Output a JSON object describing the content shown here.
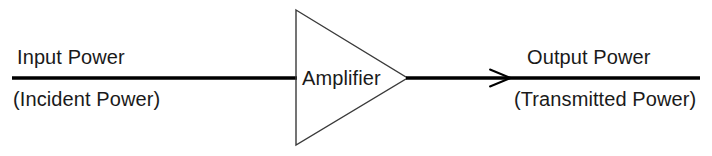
{
  "diagram": {
    "type": "block-diagram",
    "background_color": "#ffffff",
    "line_color": "#000000",
    "outline_color": "#3a3a3a",
    "text_color": "#1a1a1a",
    "block": {
      "shape": "triangle",
      "label": "Amplifier"
    },
    "input": {
      "primary_label": "Input Power",
      "secondary_label": "(Incident Power)"
    },
    "output": {
      "primary_label": "Output Power",
      "secondary_label": "(Transmitted Power)",
      "arrow_direction": "right"
    }
  }
}
